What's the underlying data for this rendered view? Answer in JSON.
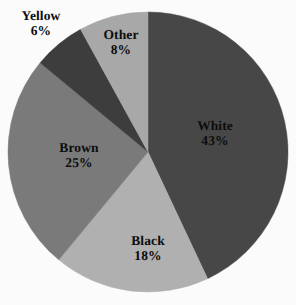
{
  "chart_data": {
    "type": "pie",
    "title": "",
    "subtitle": "",
    "xlabel": "",
    "ylabel": "",
    "legend_position": "none",
    "grid": false,
    "start_angle_deg": 0,
    "direction": "clockwise",
    "background_color": "#fbfbfb",
    "label_color": "#0d0d0d",
    "categories": [
      "White",
      "Black",
      "Brown",
      "Yellow",
      "Other"
    ],
    "values": [
      43,
      18,
      25,
      6,
      8
    ],
    "value_suffix": "%",
    "slices": [
      {
        "label": "White",
        "value": 43,
        "value_text": "43%",
        "color": "#474747",
        "label_placement": "inside",
        "label_x": 215,
        "label_y": 133
      },
      {
        "label": "Black",
        "value": 18,
        "value_text": "18%",
        "color": "#b0b0b0",
        "label_placement": "inside",
        "label_x": 148,
        "label_y": 248
      },
      {
        "label": "Brown",
        "value": 25,
        "value_text": "25%",
        "color": "#7a7a7a",
        "label_placement": "inside",
        "label_x": 79,
        "label_y": 155
      },
      {
        "label": "Yellow",
        "value": 6,
        "value_text": "6%",
        "color": "#3d3d3d",
        "label_placement": "outside",
        "label_x": 41,
        "label_y": 23
      },
      {
        "label": "Other",
        "value": 8,
        "value_text": "8%",
        "color": "#a8a8a8",
        "label_placement": "inside",
        "label_x": 121,
        "label_y": 42
      }
    ],
    "geometry": {
      "center_x": 148,
      "center_y": 152,
      "radius": 140
    }
  }
}
